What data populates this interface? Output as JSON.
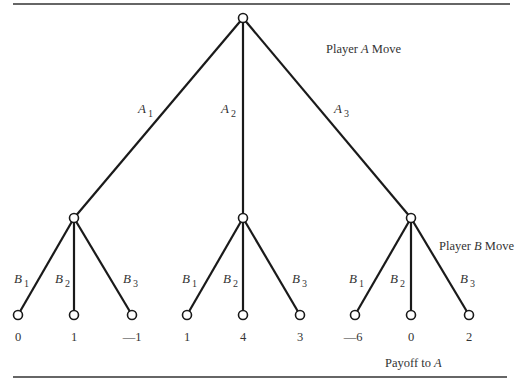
{
  "diagram": {
    "type": "game-tree",
    "labels": {
      "player_a_move": {
        "prefix": "Player ",
        "player": "A",
        "suffix": " Move"
      },
      "player_b_move": {
        "prefix": "Player ",
        "player": "B",
        "suffix": " Move"
      },
      "payoff": {
        "prefix": "Payoff to ",
        "player": "A"
      }
    },
    "a_branches": [
      {
        "letter": "A",
        "sub": "1"
      },
      {
        "letter": "A",
        "sub": "2"
      },
      {
        "letter": "A",
        "sub": "3"
      }
    ],
    "b_branches": [
      {
        "letter": "B",
        "sub": "1"
      },
      {
        "letter": "B",
        "sub": "2"
      },
      {
        "letter": "B",
        "sub": "3"
      }
    ],
    "payoffs": [
      "0",
      "1",
      "—1",
      "1",
      "4",
      "3",
      "—6",
      "0",
      "2"
    ]
  }
}
